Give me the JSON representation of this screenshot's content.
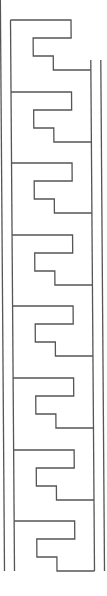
{
  "canvas": {
    "width": 107,
    "height": 596,
    "background": "#ffffff"
  },
  "stroke": {
    "color": "#555555",
    "width": 1.3
  },
  "pattern": {
    "name": "meander-border-strip",
    "units": 8,
    "top_y": 20,
    "period": 71.6,
    "unit_height": 50,
    "bottom_line_y": 571,
    "skew_x_total": 4,
    "rails": {
      "outer_left_x": 0.5,
      "inner_left_x": 10.5,
      "inner_right_x": 90.5,
      "outer_right_x": 100.5
    },
    "motif": {
      "top_right_x": 71,
      "notch_x": 33,
      "notch_y": 18,
      "notch_bottom_y": 36,
      "step_x": 53,
      "bottom_y": 50
    }
  }
}
